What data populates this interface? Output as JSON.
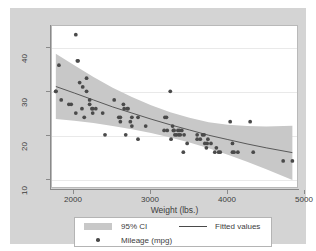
{
  "figure": {
    "background_color": "#d4d4d4",
    "plot_background_color": "#ffffff",
    "band_color": "#c8c8c8",
    "marker_color": "#4a4a4a",
    "line_color": "#4a4a4a"
  },
  "axes": {
    "x_title": "Weight (lbs.)",
    "x_ticks": [
      "2000",
      "3000",
      "4000",
      "5000"
    ],
    "y_ticks": [
      "10",
      "20",
      "30",
      "40"
    ]
  },
  "legend": {
    "ci_label": "95% CI",
    "points_label": "Mileage (mpg)",
    "fit_label": "Fitted values"
  },
  "chart_data": {
    "type": "scatter",
    "title": "",
    "xlabel": "Weight (lbs.)",
    "ylabel": "",
    "xlim": [
      1710,
      4900
    ],
    "ylim": [
      6,
      43
    ],
    "xticks": [
      2000,
      3000,
      4000,
      5000
    ],
    "yticks": [
      10,
      20,
      30,
      40
    ],
    "grid": true,
    "grid_axis": "y",
    "legend_position": "below-plot",
    "series": [
      {
        "name": "Mileage (mpg)",
        "type": "scatter",
        "marker": "circle",
        "color": "#4a4a4a",
        "points": [
          [
            1760,
            28
          ],
          [
            1760,
            28
          ],
          [
            1800,
            34
          ],
          [
            1830,
            26
          ],
          [
            1930,
            25
          ],
          [
            1960,
            25
          ],
          [
            2020,
            41
          ],
          [
            2020,
            23
          ],
          [
            2040,
            35
          ],
          [
            2050,
            35
          ],
          [
            2070,
            30
          ],
          [
            2100,
            24
          ],
          [
            2110,
            29
          ],
          [
            2130,
            22
          ],
          [
            2160,
            31
          ],
          [
            2160,
            28
          ],
          [
            2200,
            26
          ],
          [
            2200,
            25
          ],
          [
            2230,
            24
          ],
          [
            2240,
            24
          ],
          [
            2240,
            23
          ],
          [
            2280,
            24
          ],
          [
            2370,
            23
          ],
          [
            2400,
            18
          ],
          [
            2520,
            26
          ],
          [
            2580,
            22
          ],
          [
            2600,
            22
          ],
          [
            2600,
            21
          ],
          [
            2640,
            25
          ],
          [
            2650,
            24
          ],
          [
            2670,
            18
          ],
          [
            2690,
            24
          ],
          [
            2700,
            24
          ],
          [
            2730,
            21
          ],
          [
            2750,
            22
          ],
          [
            2750,
            20
          ],
          [
            2830,
            17
          ],
          [
            2830,
            22
          ],
          [
            2930,
            20
          ],
          [
            3170,
            19
          ],
          [
            3180,
            22
          ],
          [
            3200,
            22
          ],
          [
            3210,
            19
          ],
          [
            3250,
            28
          ],
          [
            3260,
            17
          ],
          [
            3280,
            20
          ],
          [
            3290,
            19
          ],
          [
            3300,
            19
          ],
          [
            3310,
            18
          ],
          [
            3330,
            18
          ],
          [
            3350,
            19
          ],
          [
            3360,
            18
          ],
          [
            3370,
            19
          ],
          [
            3380,
            18
          ],
          [
            3400,
            19
          ],
          [
            3420,
            14
          ],
          [
            3430,
            18
          ],
          [
            3470,
            16
          ],
          [
            3600,
            18
          ],
          [
            3600,
            17
          ],
          [
            3640,
            17
          ],
          [
            3670,
            18
          ],
          [
            3690,
            18
          ],
          [
            3700,
            16
          ],
          [
            3720,
            15
          ],
          [
            3730,
            16
          ],
          [
            3740,
            17
          ],
          [
            3780,
            16
          ],
          [
            3830,
            14
          ],
          [
            3850,
            15
          ],
          [
            3880,
            14
          ],
          [
            3900,
            14
          ],
          [
            4030,
            21
          ],
          [
            4060,
            16
          ],
          [
            4060,
            14
          ],
          [
            4080,
            14
          ],
          [
            4130,
            14
          ],
          [
            4290,
            21
          ],
          [
            4330,
            14
          ],
          [
            4720,
            12
          ],
          [
            4840,
            12
          ]
        ]
      },
      {
        "name": "Fitted values",
        "type": "line",
        "color": "#4a4a4a",
        "x": [
          1760,
          2000,
          2250,
          2500,
          2750,
          3000,
          3250,
          3500,
          3750,
          4000,
          4250,
          4500,
          4840
        ],
        "y": [
          29.1,
          27.6,
          26.0,
          24.4,
          23.0,
          21.6,
          20.3,
          19.1,
          17.9,
          16.9,
          15.9,
          15.0,
          13.9
        ]
      },
      {
        "name": "95% CI",
        "type": "band",
        "color": "#c8c8c8",
        "x": [
          1760,
          2000,
          2250,
          2500,
          2750,
          3000,
          3250,
          3500,
          3750,
          4000,
          4250,
          4500,
          4840
        ],
        "lower": [
          21.6,
          21.2,
          20.7,
          20.0,
          19.3,
          18.4,
          17.4,
          16.2,
          14.9,
          13.4,
          11.8,
          10.1,
          7.6
        ],
        "upper": [
          36.6,
          34.0,
          31.3,
          28.8,
          26.7,
          24.8,
          23.2,
          21.9,
          20.9,
          20.3,
          20.0,
          19.9,
          20.1
        ]
      }
    ]
  }
}
